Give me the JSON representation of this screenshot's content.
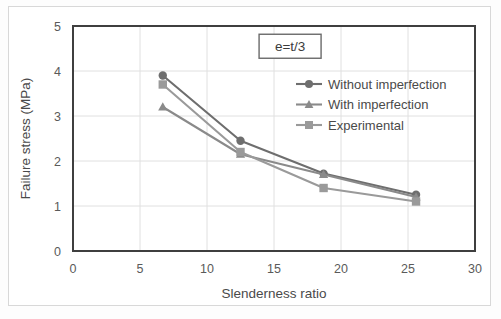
{
  "chart_data": {
    "type": "line",
    "title": "",
    "subtitle": "",
    "xlabel": "Slenderness ratio",
    "ylabel": "Failure stress (MPa)",
    "xlim": [
      0,
      30
    ],
    "ylim": [
      0,
      5
    ],
    "xticks": [
      "0",
      "5",
      "10",
      "15",
      "20",
      "25",
      "30"
    ],
    "xtick_values": [
      0,
      5,
      10,
      15,
      20,
      25,
      30
    ],
    "yticks": [
      "0",
      "1",
      "2",
      "3",
      "4",
      "5"
    ],
    "ytick_values": [
      0,
      1,
      2,
      3,
      4,
      5
    ],
    "grid": "horizontal-and-vertical-light",
    "legend_position": "upper-right-inside",
    "annotations": [
      {
        "name": "eccentricity-note",
        "text": "e=t/3",
        "x": 16.2,
        "y": 4.55,
        "boxed": true
      }
    ],
    "x": [
      6.7,
      12.5,
      18.7,
      25.6
    ],
    "series": [
      {
        "name": "Without imperfection",
        "marker": "circle",
        "color": "#6e6e6e",
        "values": [
          3.9,
          2.45,
          1.72,
          1.25
        ]
      },
      {
        "name": "With imperfection",
        "marker": "triangle",
        "color": "#8a8a8a",
        "values": [
          3.2,
          2.15,
          1.7,
          1.2
        ]
      },
      {
        "name": "Experimental",
        "marker": "square",
        "color": "#9a9a9a",
        "values": [
          3.7,
          2.2,
          1.4,
          1.1
        ]
      }
    ]
  },
  "colors": {
    "plot_border": "#3f3f3f",
    "grid": "#e0e0e0",
    "text": "#4a4a4a",
    "background": "#ffffff",
    "outer_frame": "#d8d8d8"
  }
}
